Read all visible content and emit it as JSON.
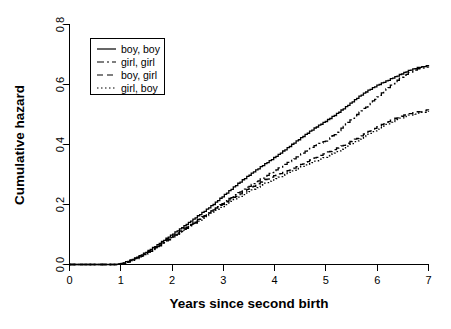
{
  "chart_data": {
    "type": "line",
    "title": "",
    "xlabel": "Years since second birth",
    "ylabel": "Cumulative hazard",
    "xlim": [
      0,
      7
    ],
    "ylim": [
      0,
      0.8
    ],
    "xticks": [
      "0",
      "1",
      "2",
      "3",
      "4",
      "5",
      "6",
      "7"
    ],
    "xtick_values": [
      0,
      1,
      2,
      3,
      4,
      5,
      6,
      7
    ],
    "yticks": [
      "0.0",
      "0.2",
      "0.4",
      "0.6",
      "0.8"
    ],
    "ytick_values": [
      0.0,
      0.2,
      0.4,
      0.6,
      0.8
    ],
    "grid": false,
    "legend_position": "top-left",
    "series": [
      {
        "name": "boy, boy",
        "linestyle": "solid",
        "dash_pattern": "none",
        "x": [
          0,
          0.5,
          0.9,
          1.0,
          1.1,
          1.2,
          1.3,
          1.4,
          1.5,
          1.6,
          1.7,
          1.8,
          1.9,
          2.0,
          2.2,
          2.4,
          2.6,
          2.8,
          3.0,
          3.2,
          3.4,
          3.6,
          3.8,
          4.0,
          4.2,
          4.4,
          4.6,
          4.8,
          5.0,
          5.2,
          5.4,
          5.6,
          5.8,
          6.0,
          6.2,
          6.4,
          6.6,
          6.8,
          7.0
        ],
        "y": [
          0.0,
          0.0,
          0.0,
          0.003,
          0.008,
          0.015,
          0.023,
          0.032,
          0.042,
          0.053,
          0.064,
          0.076,
          0.088,
          0.1,
          0.124,
          0.149,
          0.174,
          0.2,
          0.229,
          0.258,
          0.285,
          0.31,
          0.334,
          0.357,
          0.382,
          0.408,
          0.433,
          0.457,
          0.478,
          0.501,
          0.527,
          0.554,
          0.578,
          0.597,
          0.613,
          0.629,
          0.645,
          0.656,
          0.662
        ]
      },
      {
        "name": "girl, girl",
        "linestyle": "dashdot",
        "dash_pattern": "7 3 2 3",
        "x": [
          0,
          0.5,
          0.9,
          1.0,
          1.1,
          1.2,
          1.3,
          1.4,
          1.5,
          1.6,
          1.7,
          1.8,
          1.9,
          2.0,
          2.2,
          2.4,
          2.6,
          2.8,
          3.0,
          3.2,
          3.4,
          3.6,
          3.8,
          4.0,
          4.2,
          4.4,
          4.6,
          4.8,
          5.0,
          5.2,
          5.4,
          5.6,
          5.8,
          6.0,
          6.2,
          6.4,
          6.6,
          6.8,
          7.0
        ],
        "y": [
          0.0,
          0.0,
          0.0,
          0.002,
          0.006,
          0.012,
          0.019,
          0.027,
          0.036,
          0.046,
          0.057,
          0.068,
          0.079,
          0.09,
          0.112,
          0.135,
          0.158,
          0.182,
          0.206,
          0.229,
          0.25,
          0.271,
          0.292,
          0.313,
          0.334,
          0.355,
          0.377,
          0.398,
          0.412,
          0.438,
          0.47,
          0.5,
          0.528,
          0.558,
          0.588,
          0.616,
          0.638,
          0.652,
          0.657
        ]
      },
      {
        "name": "boy, girl",
        "linestyle": "dashed",
        "dash_pattern": "6 4",
        "x": [
          0,
          0.5,
          0.9,
          1.0,
          1.1,
          1.2,
          1.3,
          1.4,
          1.5,
          1.6,
          1.7,
          1.8,
          1.9,
          2.0,
          2.2,
          2.4,
          2.6,
          2.8,
          3.0,
          3.2,
          3.4,
          3.6,
          3.8,
          4.0,
          4.2,
          4.4,
          4.6,
          4.8,
          5.0,
          5.2,
          5.4,
          5.6,
          5.8,
          6.0,
          6.2,
          6.4,
          6.6,
          6.8,
          7.0
        ],
        "y": [
          0.0,
          0.0,
          0.0,
          0.002,
          0.007,
          0.013,
          0.021,
          0.029,
          0.039,
          0.049,
          0.06,
          0.071,
          0.083,
          0.094,
          0.116,
          0.138,
          0.16,
          0.182,
          0.203,
          0.223,
          0.243,
          0.262,
          0.281,
          0.296,
          0.308,
          0.323,
          0.34,
          0.356,
          0.371,
          0.386,
          0.402,
          0.42,
          0.44,
          0.458,
          0.475,
          0.49,
          0.501,
          0.508,
          0.515
        ]
      },
      {
        "name": "girl, boy",
        "linestyle": "dotted",
        "dash_pattern": "1.5 2.5",
        "x": [
          0,
          0.5,
          0.9,
          1.0,
          1.1,
          1.2,
          1.3,
          1.4,
          1.5,
          1.6,
          1.7,
          1.8,
          1.9,
          2.0,
          2.2,
          2.4,
          2.6,
          2.8,
          3.0,
          3.2,
          3.4,
          3.6,
          3.8,
          4.0,
          4.2,
          4.4,
          4.6,
          4.8,
          5.0,
          5.2,
          5.4,
          5.6,
          5.8,
          6.0,
          6.2,
          6.4,
          6.6,
          6.8,
          7.0
        ],
        "y": [
          0.0,
          0.0,
          0.0,
          0.002,
          0.006,
          0.012,
          0.02,
          0.028,
          0.037,
          0.047,
          0.058,
          0.069,
          0.08,
          0.091,
          0.112,
          0.133,
          0.154,
          0.175,
          0.196,
          0.215,
          0.234,
          0.252,
          0.269,
          0.284,
          0.3,
          0.316,
          0.331,
          0.345,
          0.358,
          0.374,
          0.392,
          0.412,
          0.431,
          0.45,
          0.468,
          0.484,
          0.496,
          0.504,
          0.51
        ]
      }
    ]
  },
  "legend": {
    "entries": [
      {
        "label": "boy, boy"
      },
      {
        "label": "girl, girl"
      },
      {
        "label": "boy, girl"
      },
      {
        "label": "girl, boy"
      }
    ]
  }
}
